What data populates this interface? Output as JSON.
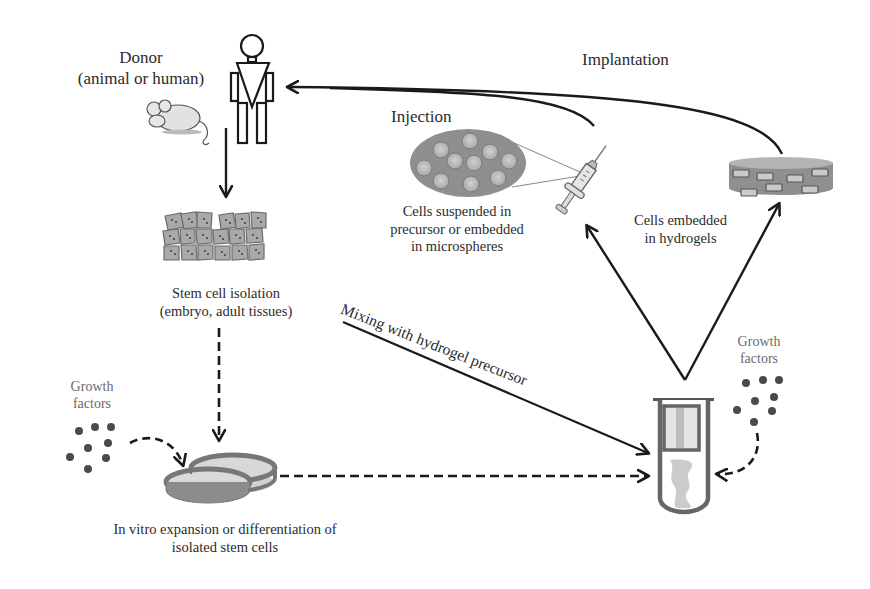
{
  "diagram": {
    "labels": {
      "donor_line1": "Donor",
      "donor_line2": "(animal or human)",
      "implantation": "Implantation",
      "injection": "Injection",
      "cells_suspended_line1": "Cells suspended in",
      "cells_suspended_line2": "precursor or embedded",
      "cells_suspended_line3": "in microspheres",
      "cells_embedded_line1": "Cells embedded",
      "cells_embedded_line2": "in hydrogels",
      "stem_cell_isolation_line1": "Stem cell isolation",
      "stem_cell_isolation_line2": "(embryo, adult tissues)",
      "mixing": "Mixing with hydrogel precursor",
      "growth_factors_left_line1": "Growth",
      "growth_factors_left_line2": "factors",
      "growth_factors_right_line1": "Growth",
      "growth_factors_right_line2": "factors",
      "in_vitro_line1": "In vitro expansion or differentiation of",
      "in_vitro_line2": "isolated stem cells"
    },
    "icons": [
      "human-figure-icon",
      "mouse-icon",
      "cell-cluster-icon",
      "microsphere-ellipse-icon",
      "syringe-icon",
      "hydrogel-disc-icon",
      "petri-dish-icon",
      "test-tube-icon",
      "growth-factor-dots-icon"
    ],
    "colors": {
      "line": "#1a1a1a",
      "fill_gray": "#9a9a9a",
      "fill_light": "#c8c8c8",
      "text": "#2b2b2b"
    }
  }
}
